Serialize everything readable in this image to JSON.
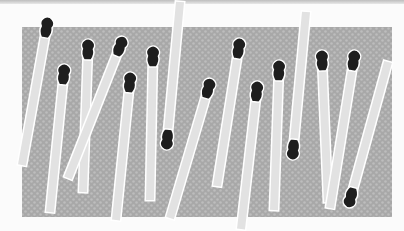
{
  "image": {
    "description": "Illustration of burnt and unburnt matchsticks scattered over a gray dotted background",
    "colors": {
      "page_background": "#fbfbfb",
      "panel_background": "#a9a9a9",
      "panel_dots": "#bcbcbc",
      "match_stick": "#e2e2e2",
      "match_outline": "#ffffff",
      "match_head": "#1e1e1e"
    },
    "panel": {
      "x": 22,
      "y": 27,
      "width": 370,
      "height": 190
    },
    "matches": [
      {
        "id": 1,
        "head": "top",
        "x1": 47,
        "y1": 25,
        "x2": 22,
        "y2": 165,
        "w": 8
      },
      {
        "id": 2,
        "head": "top",
        "x1": 64,
        "y1": 72,
        "x2": 50,
        "y2": 212,
        "w": 8
      },
      {
        "id": 3,
        "head": "top",
        "x1": 88,
        "y1": 47,
        "x2": 83,
        "y2": 192,
        "w": 8
      },
      {
        "id": 4,
        "head": "top",
        "x1": 121,
        "y1": 44,
        "x2": 68,
        "y2": 178,
        "w": 8
      },
      {
        "id": 5,
        "head": "top",
        "x1": 130,
        "y1": 80,
        "x2": 116,
        "y2": 220,
        "w": 8
      },
      {
        "id": 6,
        "head": "top",
        "x1": 153,
        "y1": 54,
        "x2": 150,
        "y2": 200,
        "w": 8
      },
      {
        "id": 7,
        "head": "bottom",
        "x1": 180,
        "y1": 2,
        "x2": 167,
        "y2": 142,
        "w": 8
      },
      {
        "id": 8,
        "head": "top",
        "x1": 209,
        "y1": 86,
        "x2": 170,
        "y2": 218,
        "w": 8
      },
      {
        "id": 9,
        "head": "top",
        "x1": 239,
        "y1": 46,
        "x2": 217,
        "y2": 186,
        "w": 8
      },
      {
        "id": 10,
        "head": "top",
        "x1": 257,
        "y1": 89,
        "x2": 241,
        "y2": 229,
        "w": 8
      },
      {
        "id": 11,
        "head": "top",
        "x1": 279,
        "y1": 68,
        "x2": 274,
        "y2": 210,
        "w": 8
      },
      {
        "id": 12,
        "head": "bottom",
        "x1": 306,
        "y1": 12,
        "x2": 293,
        "y2": 152,
        "w": 8
      },
      {
        "id": 13,
        "head": "top",
        "x1": 322,
        "y1": 58,
        "x2": 328,
        "y2": 202,
        "w": 8
      },
      {
        "id": 14,
        "head": "top",
        "x1": 354,
        "y1": 58,
        "x2": 330,
        "y2": 208,
        "w": 8
      },
      {
        "id": 15,
        "head": "bottom",
        "x1": 388,
        "y1": 62,
        "x2": 350,
        "y2": 200,
        "w": 8
      }
    ]
  }
}
